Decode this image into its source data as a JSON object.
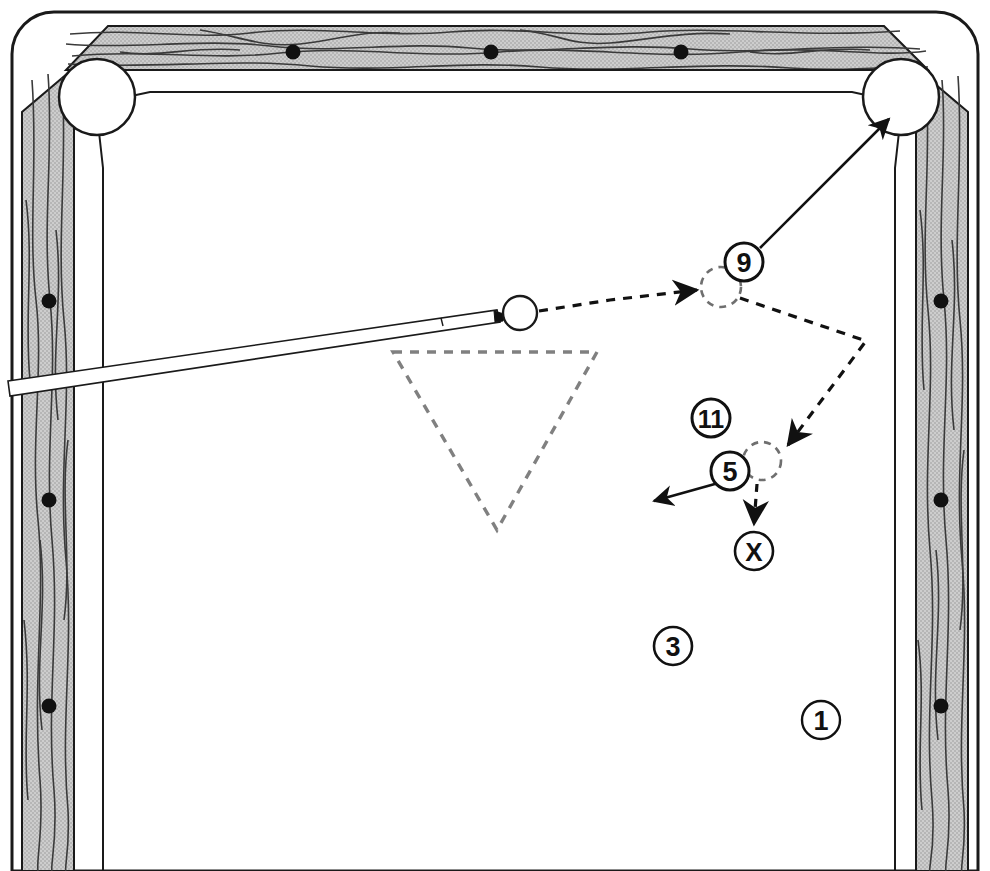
{
  "diagram": {
    "type": "billiards-shot-diagram",
    "surface_color": "#ffffff",
    "rail_color": "#c9c9c9",
    "line_color": "#1a1a1a",
    "ghost_color": "#6f6f6f"
  },
  "table": {
    "outer": {
      "x": 14,
      "y": 12,
      "width": 962,
      "height": 859,
      "corner_radius": 40
    },
    "rail_top": {
      "x": 62,
      "y": 26,
      "width": 866,
      "height": 46
    },
    "rail_left": {
      "x": 22,
      "y": 66,
      "width": 52,
      "height": 805
    },
    "rail_right": {
      "x": 916,
      "y": 66,
      "width": 52,
      "height": 805
    },
    "cloth": {
      "x": 86,
      "y": 92,
      "width": 816,
      "height": 779
    }
  },
  "pockets": [
    {
      "name": "top-left-corner-pocket",
      "cx": 97,
      "cy": 97,
      "r": 38
    },
    {
      "name": "top-right-corner-pocket",
      "cx": 901,
      "cy": 97,
      "r": 38
    }
  ],
  "diamonds": {
    "top": [
      {
        "cx": 293,
        "cy": 52
      },
      {
        "cx": 491,
        "cy": 52
      },
      {
        "cx": 681,
        "cy": 52
      }
    ],
    "left": [
      {
        "cx": 49,
        "cy": 301
      },
      {
        "cx": 49,
        "cy": 500
      },
      {
        "cx": 49,
        "cy": 706
      }
    ],
    "right": [
      {
        "cx": 941,
        "cy": 301
      },
      {
        "cx": 941,
        "cy": 500
      },
      {
        "cx": 941,
        "cy": 706
      }
    ]
  },
  "rack": {
    "label": "rack-outline",
    "points": "393,352 597,352 497,530",
    "style": "dashed"
  },
  "cue_ball": {
    "cx": 520,
    "cy": 313,
    "r": 17,
    "label": "cue-ball"
  },
  "cue_stick": {
    "butt": {
      "x": 10,
      "y": 388
    },
    "tip": {
      "x": 503,
      "y": 316
    },
    "ferrule_start_fraction": 0.88
  },
  "ghost_balls": [
    {
      "name": "ghost-ball-9",
      "cx": 721,
      "cy": 287,
      "r": 20
    },
    {
      "name": "ghost-ball-5",
      "cx": 762,
      "cy": 461,
      "r": 19
    }
  ],
  "ball_labels": [
    {
      "id": "9",
      "cx": 744,
      "cy": 262,
      "r": 19,
      "shape": "circle"
    },
    {
      "id": "11",
      "cx": 711,
      "cy": 418,
      "r": 19,
      "shape": "circle"
    },
    {
      "id": "5",
      "cx": 730,
      "cy": 471,
      "r": 19,
      "shape": "circle"
    },
    {
      "id": "X",
      "cx": 754,
      "cy": 551,
      "r": 19,
      "shape": "circle"
    },
    {
      "id": "3",
      "cx": 673,
      "cy": 646,
      "r": 19,
      "shape": "circle"
    },
    {
      "id": "1",
      "cx": 821,
      "cy": 720,
      "r": 19,
      "shape": "circle"
    }
  ],
  "paths": [
    {
      "name": "cue-ball-to-9-path",
      "style": "dashed",
      "from": "cue-ball",
      "to": "ghost-ball-9",
      "d": "M 539 311 L 610 300 L 697 290",
      "arrow": "end"
    },
    {
      "name": "cue-ball-after-contact-path",
      "style": "dashed",
      "from": "ghost-ball-9",
      "to": "ghost-ball-5",
      "d": "M 740 298 L 866 341 L 786 447",
      "arrow": "end"
    },
    {
      "name": "nine-ball-to-pocket-path",
      "style": "solid",
      "from": "9",
      "to": "top-right-corner-pocket",
      "d": "M 760 248 L 890 118",
      "arrow": "end"
    },
    {
      "name": "five-ball-direction-path",
      "style": "solid",
      "from": "5",
      "to": "left",
      "d": "M 722 482 L 651 503",
      "arrow": "end"
    },
    {
      "name": "cue-ball-final-path",
      "style": "dashed",
      "from": "ghost-ball-5",
      "to": "X",
      "d": "M 757 482 L 754 526",
      "arrow": "end"
    }
  ]
}
